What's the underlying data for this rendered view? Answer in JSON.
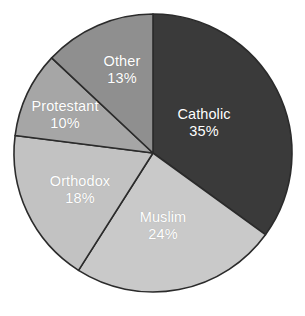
{
  "chart_data": {
    "type": "pie",
    "title": "",
    "subtitle": "",
    "xlabel": "",
    "ylabel": "",
    "legend_position": "none",
    "grid": false,
    "labels_inside_slices": true,
    "start_angle_deg": 0,
    "direction": "clockwise",
    "categories": [
      "Catholic",
      "Muslim",
      "Orthodox",
      "Protestant",
      "Other"
    ],
    "values": [
      35,
      24,
      18,
      10,
      13
    ],
    "value_suffix": "%",
    "slices": [
      {
        "label": "Catholic",
        "value": 35,
        "value_text": "35%",
        "color": "#3a3a3a",
        "label_x": 204,
        "label_y": 123
      },
      {
        "label": "Muslim",
        "value": 24,
        "value_text": "24%",
        "color": "#c9c9c9",
        "label_x": 163,
        "label_y": 226
      },
      {
        "label": "Orthodox",
        "value": 18,
        "value_text": "18%",
        "color": "#c2c2c2",
        "label_x": 80,
        "label_y": 190
      },
      {
        "label": "Protestant",
        "value": 10,
        "value_text": "10%",
        "color": "#a6a6a6",
        "label_x": 65,
        "label_y": 115
      },
      {
        "label": "Other",
        "value": 13,
        "value_text": "13%",
        "color": "#8f8f8f",
        "label_x": 122,
        "label_y": 70
      }
    ],
    "geometry": {
      "center_x": 153,
      "center_y": 153,
      "radius": 139
    },
    "colors": {
      "background": "#ffffff",
      "slice_border": "#2b2b2b",
      "label_text": "#ffffff"
    }
  }
}
